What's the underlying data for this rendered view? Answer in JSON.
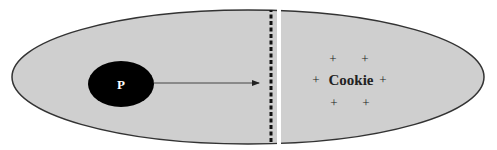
{
  "diagram": {
    "type": "membrane-translocation",
    "colors": {
      "ellipse_fill": "#cfcfcf",
      "ellipse_stroke": "#333333",
      "particle_fill": "#000000",
      "barrier_dash": "#111111",
      "gap": "#ffffff"
    },
    "particle": {
      "label": "P"
    },
    "target": {
      "label": "Cookie",
      "charge_marks": [
        "+",
        "+",
        "+",
        "+",
        "+",
        "+"
      ]
    },
    "arrow": {
      "from": "particle",
      "to": "barrier"
    },
    "barrier": {
      "style": "dashed"
    }
  }
}
